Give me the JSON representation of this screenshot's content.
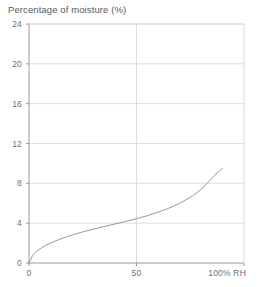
{
  "chart_data": {
    "type": "line",
    "title": "Percentage of moisture (%)",
    "subtitle": "",
    "xlabel": "100% RH",
    "ylabel": "Percentage of moisture (%)",
    "xlim": [
      0,
      100
    ],
    "ylim": [
      0,
      24
    ],
    "grid": true,
    "legend": false,
    "legend_position": "none",
    "xticks": [
      0,
      50,
      100
    ],
    "xtick_labels": [
      "0",
      "50",
      "100% RH"
    ],
    "yticks": [
      0,
      4,
      8,
      12,
      16,
      20,
      24
    ],
    "ytick_labels": [
      "0",
      "4",
      "8",
      "12",
      "16",
      "20",
      "24"
    ],
    "series": [
      {
        "name": "Moisture sorption isotherm",
        "color": "#8c8c8c",
        "x": [
          0,
          2,
          4,
          6,
          8,
          10,
          13,
          16,
          20,
          25,
          30,
          35,
          40,
          45,
          50,
          55,
          60,
          65,
          70,
          75,
          78,
          80,
          82,
          84,
          86,
          88,
          90
        ],
        "y": [
          0.0,
          0.85,
          1.25,
          1.55,
          1.8,
          2.0,
          2.28,
          2.52,
          2.8,
          3.12,
          3.4,
          3.66,
          3.92,
          4.18,
          4.45,
          4.75,
          5.1,
          5.5,
          6.0,
          6.6,
          7.05,
          7.4,
          7.8,
          8.25,
          8.75,
          9.15,
          9.5
        ]
      }
    ],
    "annotations": []
  },
  "colors": {
    "grid": "#d9d9d9",
    "axis": "#9a9a9a",
    "curve": "#8c8c8c",
    "text": "#6f7072",
    "title_text": "#58595b",
    "background": "#ffffff"
  },
  "geometry": {
    "plot_left": 29,
    "plot_right": 244,
    "plot_top": 24,
    "plot_bottom": 263
  }
}
